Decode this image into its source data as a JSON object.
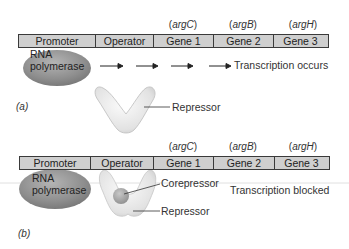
{
  "panels": [
    {
      "id": "a",
      "panel_label": "(a)",
      "segments": [
        "Promoter",
        "Operator",
        "Gene 1",
        "Gene 2",
        "Gene 3"
      ],
      "gene_names": [
        {
          "open": "(",
          "name": "argC",
          "close": ")"
        },
        {
          "open": "(",
          "name": "argB",
          "close": ")"
        },
        {
          "open": "(",
          "name": "argH",
          "close": ")"
        }
      ],
      "polymerase_label_line1": "RNA",
      "polymerase_label_line2": "polymerase",
      "status_text": "Transcription occurs",
      "repressor_label": "Repressor"
    },
    {
      "id": "b",
      "panel_label": "(b)",
      "segments": [
        "Promoter",
        "Operator",
        "Gene 1",
        "Gene 2",
        "Gene 3"
      ],
      "gene_names": [
        {
          "open": "(",
          "name": "argC",
          "close": ")"
        },
        {
          "open": "(",
          "name": "argB",
          "close": ")"
        },
        {
          "open": "(",
          "name": "argH",
          "close": ")"
        }
      ],
      "polymerase_label_line1": "RNA",
      "polymerase_label_line2": "polymerase",
      "status_text": "Transcription blocked",
      "corepressor_label": "Corepressor",
      "repressor_label": "Repressor"
    }
  ],
  "colors": {
    "dna_bar_fill": "#cfcfcf",
    "dna_bar_border": "#3a3a3a",
    "polymerase": "#8a8a8a",
    "repressor": "#e6e6e6",
    "corepressor": "#a8a8a8"
  }
}
